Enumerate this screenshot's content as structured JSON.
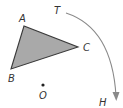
{
  "diagram": {
    "type": "geometry-rotation",
    "colors": {
      "triangle_fill": "#a9a9a9",
      "triangle_stroke": "#3a3a3a",
      "arc_stroke": "#8a8a8a",
      "text": "#333333",
      "point": "#222222"
    },
    "triangle": {
      "vertices": [
        {
          "name": "A",
          "x": 24,
          "y": 26
        },
        {
          "name": "B",
          "x": 11,
          "y": 69
        },
        {
          "name": "C",
          "x": 78,
          "y": 47
        }
      ]
    },
    "labels": {
      "A": "A",
      "B": "B",
      "C": "C",
      "O": "O",
      "T": "T",
      "H": "H"
    },
    "center_point": {
      "name": "O",
      "x": 43,
      "y": 85
    },
    "rotation_arc": {
      "from": "T",
      "to": "H",
      "direction": "clockwise",
      "start": {
        "x": 66,
        "y": 13
      },
      "end": {
        "x": 116,
        "y": 100
      }
    }
  }
}
